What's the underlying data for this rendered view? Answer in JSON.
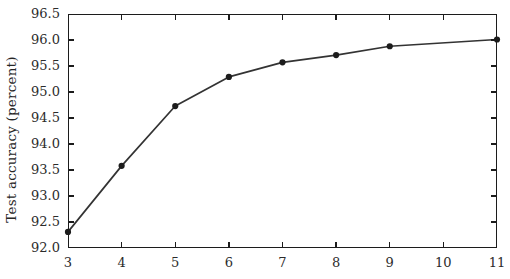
{
  "chart_data": {
    "type": "line",
    "title": "",
    "subtitle": "",
    "xlabel": "",
    "ylabel": "Test accuracy (percent)",
    "x": [
      3,
      4,
      5,
      6,
      7,
      8,
      9,
      11
    ],
    "values": [
      92.31,
      93.58,
      94.73,
      95.29,
      95.57,
      95.71,
      95.88,
      96.01
    ],
    "series": [
      {
        "name": "Test accuracy",
        "x": [
          3,
          4,
          5,
          6,
          7,
          8,
          9,
          11
        ],
        "values": [
          92.31,
          93.58,
          94.73,
          95.29,
          95.57,
          95.71,
          95.88,
          96.01
        ]
      }
    ],
    "xlim": [
      3,
      11
    ],
    "ylim": [
      92.0,
      96.5
    ],
    "xticks": [
      3,
      4,
      5,
      6,
      7,
      8,
      9,
      10,
      11
    ],
    "xtick_labels": [
      "3",
      "4",
      "5",
      "6",
      "7",
      "8",
      "9",
      "10",
      "11"
    ],
    "yticks": [
      92.0,
      92.5,
      93.0,
      93.5,
      94.0,
      94.5,
      95.0,
      95.5,
      96.0,
      96.5
    ],
    "ytick_labels": [
      "92.0",
      "92.5",
      "93.0",
      "93.5",
      "94.0",
      "94.5",
      "95.0",
      "95.5",
      "96.0",
      "96.5"
    ],
    "grid": false,
    "legend": null,
    "legend_position": "none",
    "annotations": [],
    "marker": "filled-circle",
    "line_color": "#333333",
    "marker_color": "#1c1c1c",
    "axis_color": "#1c1c1c",
    "background_color": "#ffffff"
  }
}
